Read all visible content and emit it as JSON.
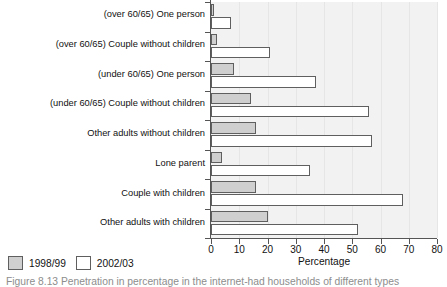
{
  "chart_data": {
    "type": "bar",
    "orientation": "horizontal",
    "title": "",
    "xlabel": "Percentage",
    "ylabel": "",
    "xlim": [
      0,
      80
    ],
    "xticks": [
      0,
      10,
      20,
      30,
      40,
      50,
      60,
      70,
      80
    ],
    "grid": true,
    "legend_position": "bottom-left",
    "categories": [
      "(over 60/65) One person",
      "(over 60/65) Couple without children",
      "(under 60/65) One person",
      "(under 60/65) Couple without children",
      "Other adults without children",
      "Lone parent",
      "Couple with children",
      "Other adults with children"
    ],
    "series": [
      {
        "name": "1998/99",
        "color": "#cfcfcf",
        "values": [
          1,
          2,
          8,
          14,
          16,
          4,
          16,
          20
        ]
      },
      {
        "name": "2002/03",
        "color": "#ffffff",
        "values": [
          7,
          21,
          37,
          56,
          57,
          35,
          68,
          52
        ]
      }
    ]
  },
  "legend": {
    "items": [
      {
        "label": "1998/99",
        "swatch": "s1998"
      },
      {
        "label": "2002/03",
        "swatch": "s2002"
      }
    ]
  },
  "caption": {
    "text": "Figure 8.13  Penetration in percentage in the internet-had households of different types"
  }
}
